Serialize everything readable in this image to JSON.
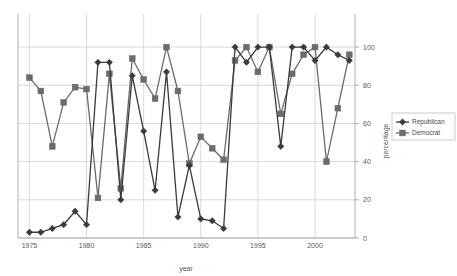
{
  "chart_data": {
    "type": "line",
    "title": "",
    "subtitle": "",
    "xlabel": "year",
    "ylabel": "percentage",
    "xlim": [
      1974,
      2003.5
    ],
    "ylim": [
      0,
      110
    ],
    "xticks": [
      1975,
      1980,
      1985,
      1990,
      1995,
      2000
    ],
    "yticks": [
      0,
      20,
      40,
      60,
      80,
      100
    ],
    "xtick_labels": [
      "1975",
      "1980",
      "1985",
      "1990",
      "1995",
      "2000"
    ],
    "ytick_labels": [
      "0",
      "20",
      "40",
      "60",
      "80",
      "100"
    ],
    "grid": true,
    "grid_axis": "both",
    "legend_position": "right",
    "y_axis_side": "right",
    "x": [
      1975,
      1976,
      1977,
      1978,
      1979,
      1980,
      1981,
      1982,
      1983,
      1984,
      1985,
      1986,
      1987,
      1988,
      1989,
      1990,
      1991,
      1992,
      1993,
      1994,
      1995,
      1996,
      1997,
      1998,
      1999,
      2000,
      2001,
      2002,
      2003
    ],
    "series": [
      {
        "name": "Republican",
        "color": "#3a3a3a",
        "marker": "diamond",
        "values": [
          3,
          3,
          5,
          7,
          14,
          7,
          92,
          92,
          20,
          85,
          56,
          25,
          87,
          11,
          38,
          10,
          9,
          5,
          100,
          92,
          100,
          100,
          48,
          100,
          100,
          93,
          100,
          96,
          93
        ]
      },
      {
        "name": "Democrat",
        "color": "#6b6b6b",
        "marker": "square",
        "values": [
          84,
          77,
          48,
          71,
          79,
          78,
          21,
          86,
          26,
          94,
          83,
          73,
          100,
          77,
          39,
          53,
          47,
          41,
          93,
          100,
          87,
          100,
          65,
          86,
          96,
          100,
          40,
          68,
          96
        ]
      }
    ],
    "legend_entries": [
      "Republican",
      "Democrat"
    ]
  },
  "axis": {
    "x_title": "year",
    "y_title": "percentage"
  },
  "legend": {
    "items": [
      {
        "label": "Republican"
      },
      {
        "label": "Democrat"
      }
    ]
  }
}
